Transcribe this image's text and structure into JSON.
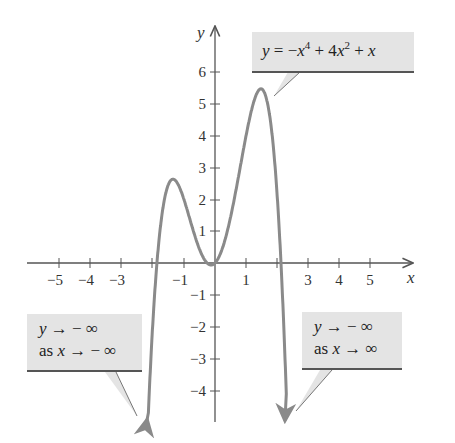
{
  "chart_data": {
    "type": "line",
    "title": "",
    "function": "y = -x^4 + 4x^2 + x",
    "xlabel": "x",
    "ylabel": "y",
    "xlim": [
      -6,
      6
    ],
    "ylim": [
      -5,
      7
    ],
    "x_ticks": [
      -5,
      -4,
      -3,
      -2,
      -1,
      1,
      2,
      3,
      4,
      5
    ],
    "x_tick_labels": [
      "−5",
      "−4",
      "−3",
      "−1",
      "1",
      "3",
      "4",
      "5"
    ],
    "y_ticks": [
      -4,
      -3,
      -2,
      -1,
      1,
      2,
      3,
      4,
      5,
      6
    ],
    "y_tick_labels": [
      "−4",
      "−3",
      "−2",
      "−1",
      "1",
      "2",
      "3",
      "4",
      "5",
      "6"
    ],
    "grid": false,
    "series": [
      {
        "name": "y = -x^4 + 4x^2 + x",
        "color": "#8a8a8a",
        "x": [
          -2.2,
          -2.0,
          -1.8,
          -1.5,
          -1.3,
          -1.0,
          -0.5,
          -0.13,
          0,
          0.5,
          1.0,
          1.3,
          1.5,
          1.8,
          2.0,
          2.2
        ],
        "y": [
          -5.27,
          -2.0,
          1.66,
          2.44,
          2.59,
          2.0,
          0.44,
          -0.06,
          0,
          1.44,
          4.0,
          5.18,
          5.44,
          4.66,
          2.0,
          -2.27
        ]
      }
    ],
    "annotations": [
      {
        "text": "y = −x⁴ + 4x² + x",
        "points_to": [
          1.6,
          5.3
        ]
      },
      {
        "text": "y → −∞ as x → −∞",
        "points_to": [
          -2.2,
          -5.0
        ]
      },
      {
        "text": "y → −∞ as x → ∞",
        "points_to": [
          2.2,
          -5.0
        ]
      }
    ]
  },
  "labels": {
    "x_axis": "x",
    "y_axis": "y",
    "eq": {
      "lhs": "y",
      "eq": " = −",
      "x1": "x",
      "p1": "4",
      "mid": " + 4",
      "x2": "x",
      "p2": "2",
      "plus": " + ",
      "x3": "x"
    },
    "left": {
      "l1_y": "y",
      "l1_rest": " → − ∞",
      "l2_as": "as ",
      "l2_x": "x",
      "l2_rest": " → − ∞"
    },
    "right": {
      "l1_y": "y",
      "l1_rest": " → − ∞",
      "l2_as": "as ",
      "l2_x": "x",
      "l2_rest": " → ∞"
    }
  },
  "colors": {
    "curve": "#8a8a8a",
    "axis": "#555555",
    "callout_bg": "#e4e4e4"
  }
}
